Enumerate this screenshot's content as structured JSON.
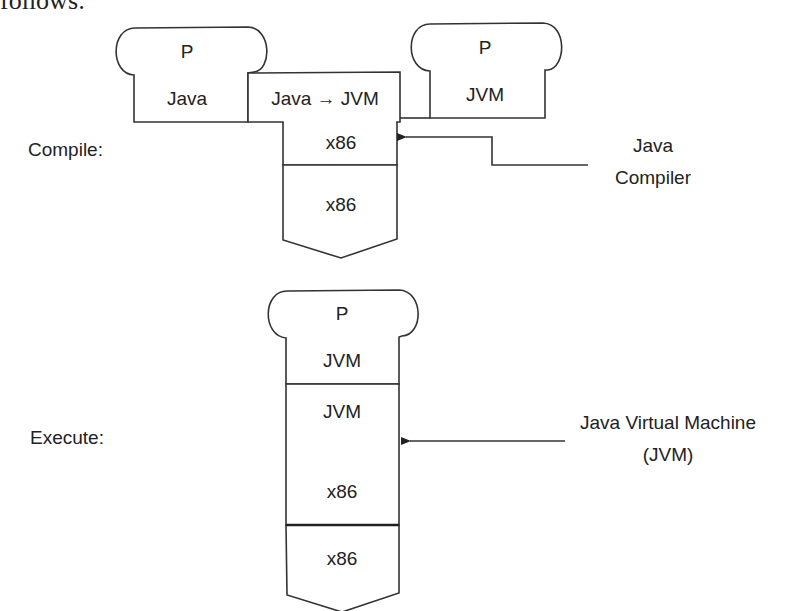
{
  "intro_text": "follows:",
  "compile": {
    "label": "Compile:",
    "program_source": {
      "top": "P",
      "bottom": "Java"
    },
    "compiler_box": {
      "top": "Java → JVM",
      "middle": "x86"
    },
    "machine": {
      "label": "x86"
    },
    "program_output": {
      "top": "P",
      "bottom": "JVM"
    },
    "callout": {
      "line1": "Java",
      "line2": "Compiler"
    }
  },
  "execute": {
    "label": "Execute:",
    "program": {
      "top": "P",
      "bottom": "JVM"
    },
    "interpreter": {
      "top": "JVM",
      "bottom": "x86"
    },
    "machine": {
      "label": "x86"
    },
    "callout": {
      "line1": "Java Virtual Machine",
      "line2": "(JVM)"
    }
  }
}
